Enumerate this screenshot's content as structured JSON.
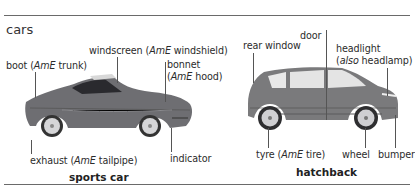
{
  "section": {
    "title": "cars"
  },
  "sports_car": {
    "caption": "sports car",
    "body_color": "#6e6e72",
    "labels": {
      "boot": {
        "main": "boot (",
        "ame": "AmE",
        "rest": " trunk)"
      },
      "windscreen": {
        "main": "windscreen (",
        "ame": "AmE",
        "rest": " windshield)"
      },
      "bonnet_1": "bonnet",
      "bonnet_2": {
        "main": "(",
        "ame": "AmE",
        "rest": " hood)"
      },
      "exhaust": {
        "main": "exhaust (",
        "ame": "AmE",
        "rest": " tailpipe)"
      },
      "indicator": "indicator"
    }
  },
  "hatchback": {
    "caption": "hatchback",
    "body_color": "#7a7a7c",
    "labels": {
      "rear_window": "rear window",
      "door": "door",
      "headlight_1": "headlight",
      "headlight_2": {
        "main": "(",
        "also": "also",
        "rest": " headlamp)"
      },
      "tyre": {
        "main": "tyre (",
        "ame": "AmE",
        "rest": " tire)"
      },
      "wheel": "wheel",
      "bumper": "bumper"
    }
  }
}
